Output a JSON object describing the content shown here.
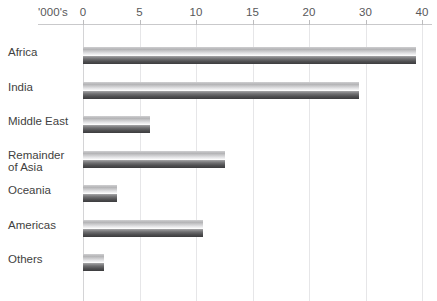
{
  "chart_data": {
    "type": "bar",
    "orientation": "horizontal",
    "title": "",
    "subtitle": "",
    "xlabel": "'000's",
    "ylabel": "",
    "units_label": "'000's",
    "categories": [
      "Africa",
      "India",
      "Middle East",
      "Remainder\nof Asia",
      "Oceania",
      "Americas",
      "Others"
    ],
    "values": [
      39.0,
      28.8,
      5.9,
      12.6,
      3.0,
      10.6,
      1.9
    ],
    "tick_labels": [
      "0",
      "5",
      "10",
      "15",
      "20",
      "30",
      "40"
    ],
    "tick_values": [
      0,
      5,
      10,
      15,
      20,
      30,
      40
    ],
    "xlim": [
      0,
      40
    ],
    "grid": true,
    "grid_axis": "x",
    "legend": null,
    "legend_position": "none",
    "annotations": [],
    "bar_style": "glossy-gradient-grey",
    "colors": {
      "background": "#ffffff",
      "bar_highlight": "#ffffff",
      "bar_light": "#cfcfd1",
      "bar_dark": "#3c3c3e",
      "gridline": "#e6e6e8",
      "axis_rule": "#c9c9cb",
      "tick_text": "#58585a",
      "category_text": "#3f3f41"
    }
  },
  "axis": {
    "units_label": "'000's",
    "ticks": [
      {
        "label": "0"
      },
      {
        "label": "5"
      },
      {
        "label": "10"
      },
      {
        "label": "15"
      },
      {
        "label": "20"
      },
      {
        "label": "30"
      },
      {
        "label": "40"
      }
    ]
  },
  "rows": [
    {
      "label": "Africa",
      "value": 39.0
    },
    {
      "label": "India",
      "value": 28.8
    },
    {
      "label": "Middle East",
      "value": 5.9
    },
    {
      "label": "Remainder\nof Asia",
      "value": 12.6
    },
    {
      "label": "Oceania",
      "value": 3.0
    },
    {
      "label": "Americas",
      "value": 10.6
    },
    {
      "label": "Others",
      "value": 1.9
    }
  ]
}
